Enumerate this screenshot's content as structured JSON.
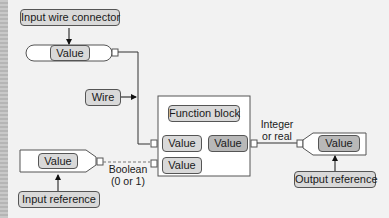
{
  "diagram": {
    "input_wire_connector": {
      "label": "Input wire connector",
      "value": "Value"
    },
    "wire": {
      "label": "Wire"
    },
    "function_block": {
      "title": "Function block",
      "inputs": [
        "Value",
        "Value"
      ],
      "output": "Value"
    },
    "input_reference": {
      "label": "Input reference",
      "value": "Value"
    },
    "output_reference": {
      "label": "Output reference",
      "value": "Value"
    },
    "annotations": {
      "boolean_line1": "Boolean",
      "boolean_line2": "(0 or 1)",
      "integer_line1": "Integer",
      "integer_line2": "or real"
    }
  }
}
